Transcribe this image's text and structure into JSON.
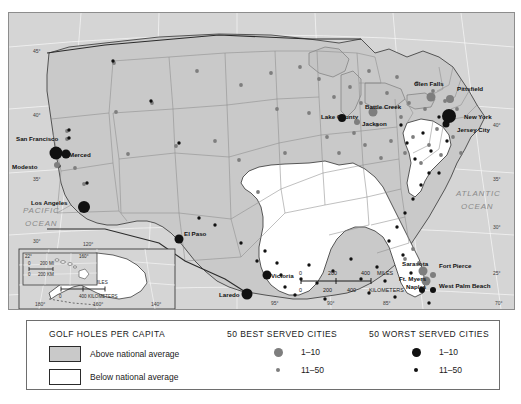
{
  "map": {
    "title": "Golf holes per capita map of the United States",
    "ocean_labels": [
      {
        "name": "pacific",
        "text": "PACIFIC",
        "x": 14,
        "y": 200
      },
      {
        "name": "pacific2",
        "text": "OCEAN",
        "x": 16,
        "y": 213
      },
      {
        "name": "atlantic",
        "text": "ATLANTIC",
        "x": 447,
        "y": 183
      },
      {
        "name": "atlantic2",
        "text": "OCEAN",
        "x": 452,
        "y": 196
      }
    ],
    "cities": [
      {
        "label": "San Francisco",
        "lx": 7,
        "ly": 128,
        "anchor": "start",
        "dx": 47,
        "dy": 140,
        "r": 6.5,
        "cls": "worst"
      },
      {
        "label": "Merced",
        "lx": 60,
        "ly": 144,
        "anchor": "start",
        "dx": 57,
        "dy": 141,
        "r": 4.5,
        "cls": "worst"
      },
      {
        "label": "Modesto",
        "lx": 3,
        "ly": 156,
        "anchor": "start",
        "dx": 48,
        "dy": 152,
        "r": 3.0,
        "cls": "best"
      },
      {
        "label": "Los Angeles",
        "lx": 22,
        "ly": 192,
        "anchor": "start",
        "dx": 75,
        "dy": 194,
        "r": 6.0,
        "cls": "worst"
      },
      {
        "label": "El Paso",
        "lx": 175,
        "ly": 223,
        "anchor": "start",
        "dx": 170,
        "dy": 226,
        "r": 4.5,
        "cls": "worst"
      },
      {
        "label": "Laredo",
        "lx": 210,
        "ly": 284,
        "anchor": "start",
        "dx": 238,
        "dy": 281,
        "r": 5.5,
        "cls": "worst"
      },
      {
        "label": "Victoria",
        "lx": 262,
        "ly": 265,
        "anchor": "start",
        "dx": 258,
        "dy": 262,
        "r": 4.5,
        "cls": "worst"
      },
      {
        "label": "Lake County",
        "lx": 312,
        "ly": 106,
        "anchor": "start",
        "dx": 333,
        "dy": 105,
        "r": 4.0,
        "cls": "worst"
      },
      {
        "label": "Battle Creek",
        "lx": 356,
        "ly": 96,
        "anchor": "start",
        "dx": 364,
        "dy": 99,
        "r": 4.5,
        "cls": "best"
      },
      {
        "label": "Jackson",
        "lx": 353,
        "ly": 113,
        "anchor": "start",
        "dx": 348,
        "dy": 109,
        "r": 3.0,
        "cls": "best"
      },
      {
        "label": "Glen Falls",
        "lx": 405,
        "ly": 73,
        "anchor": "start",
        "dx": 422,
        "dy": 84,
        "r": 4.5,
        "cls": "best"
      },
      {
        "label": "Pittsfield",
        "lx": 448,
        "ly": 78,
        "anchor": "start",
        "dx": 441,
        "dy": 86,
        "r": 4.0,
        "cls": "best"
      },
      {
        "label": "New York",
        "lx": 455,
        "ly": 106,
        "anchor": "start",
        "dx": 440,
        "dy": 103,
        "r": 7.0,
        "cls": "worst"
      },
      {
        "label": "Jersey City",
        "lx": 448,
        "ly": 119,
        "anchor": "start",
        "dx": 437,
        "dy": 111,
        "r": 3.5,
        "cls": "worst"
      },
      {
        "label": "Sarasota",
        "lx": 393,
        "ly": 253,
        "anchor": "start",
        "dx": 414,
        "dy": 258,
        "r": 4.5,
        "cls": "best"
      },
      {
        "label": "Ft. Myers",
        "lx": 390,
        "ly": 268,
        "anchor": "start",
        "dx": 417,
        "dy": 268,
        "r": 4.5,
        "cls": "best"
      },
      {
        "label": "Naples",
        "lx": 397,
        "ly": 276,
        "anchor": "start",
        "dx": 413,
        "dy": 277,
        "r": 3.0,
        "cls": "worst"
      },
      {
        "label": "Fort Pierce",
        "lx": 430,
        "ly": 255,
        "anchor": "start",
        "dx": 424,
        "dy": 262,
        "r": 3.0,
        "cls": "best"
      },
      {
        "label": "West Palm Beach",
        "lx": 430,
        "ly": 275,
        "anchor": "start",
        "dx": 424,
        "dy": 277,
        "r": 3.0,
        "cls": "worst"
      },
      {
        "label": "Anchorage",
        "lx": 100,
        "ly": 277,
        "anchor": "start",
        "dx": 125,
        "dy": 281,
        "r": 6.0,
        "cls": "worst"
      }
    ],
    "lat_ticks_left": [
      "45°",
      "40°",
      "35°",
      "30°"
    ],
    "lat_ticks_right": [
      "40°",
      "35°",
      "30°",
      "25°"
    ],
    "lon_ticks_bottom_main": [
      "95°",
      "90°",
      "85°",
      "70°"
    ],
    "lon_ticks_bottom_inset": [
      "180°",
      "160°",
      "140°"
    ],
    "inset_alaska": {
      "scale_miles": "400 MILES",
      "scale_km": "400 KILOMETERS",
      "zero": "0",
      "top_lon": "120°"
    },
    "inset_hawaii": {
      "corner_lat": "22°",
      "corner_lon": "160°",
      "scale_miles": "200 MI",
      "scale_km": "200 KM",
      "zero": "0"
    },
    "scale_bar": {
      "miles_ticks": [
        "0",
        "200",
        "400"
      ],
      "miles_unit": "MILES",
      "km_ticks": [
        "0",
        "200",
        "400"
      ],
      "km_unit": "KILOMETERS"
    }
  },
  "legend": {
    "shading": {
      "title": "GOLF HOLES PER CAPITA",
      "items": [
        {
          "label": "Above national average",
          "swatch": "above"
        },
        {
          "label": "Below national average",
          "swatch": "below"
        }
      ]
    },
    "best": {
      "title": "50 BEST SERVED CITIES",
      "items": [
        {
          "label": "1–10",
          "size": "lg"
        },
        {
          "label": "11–50",
          "size": "sm"
        }
      ]
    },
    "worst": {
      "title": "50 WORST SERVED CITIES",
      "items": [
        {
          "label": "1–10",
          "size": "lg"
        },
        {
          "label": "11–50",
          "size": "sm"
        }
      ]
    }
  },
  "colors": {
    "above_average": "#c9c9c9",
    "below_average": "#ffffff",
    "best_dot": "#7e7e7e",
    "worst_dot": "#111111",
    "ocean": "#d5d5d5",
    "border": "#6e6e6e"
  },
  "minor_dots_best": [
    [
      58,
      118
    ],
    [
      58,
      126
    ],
    [
      66,
      155
    ],
    [
      75,
      171
    ],
    [
      48,
      152
    ],
    [
      107,
      99
    ],
    [
      119,
      141
    ],
    [
      105,
      50
    ],
    [
      143,
      90
    ],
    [
      167,
      133
    ],
    [
      188,
      58
    ],
    [
      206,
      128
    ],
    [
      232,
      72
    ],
    [
      230,
      147
    ],
    [
      249,
      179
    ],
    [
      262,
      60
    ],
    [
      268,
      96
    ],
    [
      276,
      140
    ],
    [
      291,
      54
    ],
    [
      300,
      100
    ],
    [
      310,
      66
    ],
    [
      318,
      124
    ],
    [
      325,
      84
    ],
    [
      330,
      140
    ],
    [
      341,
      74
    ],
    [
      345,
      120
    ],
    [
      352,
      90
    ],
    [
      356,
      132
    ],
    [
      360,
      58
    ],
    [
      368,
      112
    ],
    [
      372,
      145
    ],
    [
      378,
      80
    ],
    [
      382,
      128
    ],
    [
      388,
      64
    ],
    [
      392,
      104
    ],
    [
      396,
      140
    ],
    [
      400,
      90
    ],
    [
      404,
      124
    ],
    [
      408,
      70
    ],
    [
      412,
      150
    ],
    [
      416,
      96
    ],
    [
      420,
      132
    ],
    [
      424,
      78
    ],
    [
      428,
      116
    ],
    [
      432,
      142
    ],
    [
      436,
      88
    ],
    [
      444,
      124
    ],
    [
      448,
      96
    ],
    [
      452,
      140
    ],
    [
      396,
      246
    ],
    [
      404,
      236
    ],
    [
      410,
      250
    ]
  ],
  "minor_dots_worst": [
    [
      60,
      117
    ],
    [
      60,
      125
    ],
    [
      50,
      153
    ],
    [
      78,
      170
    ],
    [
      104,
      48
    ],
    [
      142,
      88
    ],
    [
      170,
      130
    ],
    [
      190,
      205
    ],
    [
      206,
      212
    ],
    [
      232,
      230
    ],
    [
      248,
      248
    ],
    [
      256,
      238
    ],
    [
      268,
      250
    ],
    [
      272,
      262
    ],
    [
      276,
      274
    ],
    [
      286,
      282
    ],
    [
      292,
      266
    ],
    [
      300,
      252
    ],
    [
      308,
      270
    ],
    [
      316,
      286
    ],
    [
      324,
      258
    ],
    [
      334,
      104
    ],
    [
      342,
      246
    ],
    [
      352,
      266
    ],
    [
      360,
      280
    ],
    [
      368,
      254
    ],
    [
      376,
      268
    ],
    [
      386,
      284
    ],
    [
      394,
      242
    ],
    [
      402,
      260
    ],
    [
      412,
      276
    ],
    [
      420,
      290
    ],
    [
      392,
      112
    ],
    [
      398,
      130
    ],
    [
      406,
      146
    ],
    [
      414,
      120
    ],
    [
      422,
      138
    ],
    [
      430,
      160
    ],
    [
      438,
      128
    ],
    [
      430,
      104
    ],
    [
      420,
      160
    ],
    [
      412,
      172
    ],
    [
      404,
      186
    ],
    [
      396,
      200
    ],
    [
      388,
      214
    ],
    [
      380,
      228
    ]
  ]
}
